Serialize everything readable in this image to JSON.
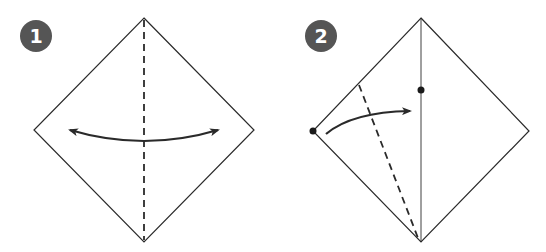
{
  "colors": {
    "line": "#2a2a2a",
    "badge": "#555555",
    "badge_text": "#ffffff",
    "background": "#ffffff"
  },
  "steps": [
    {
      "number": "1",
      "description": "Square paper as diamond; dashed vertical valley fold; double-headed arrow fold and unfold"
    },
    {
      "number": "2",
      "description": "Crease line in center; fold left corner to the marked point on the center line along dashed line"
    }
  ]
}
